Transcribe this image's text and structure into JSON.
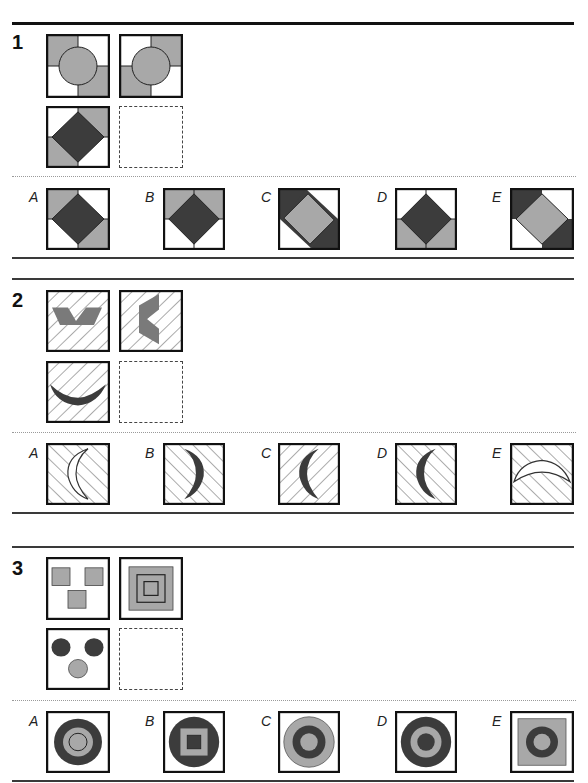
{
  "colors": {
    "dark": "#3c3c3c",
    "mid": "#a8a8a8",
    "light": "#ffffff",
    "line": "#111111"
  },
  "questions": [
    {
      "number": "1",
      "grid": [
        {
          "position": "top-left",
          "content": "circle over quadrants, grey top-left & bottom-right"
        },
        {
          "position": "top-right",
          "content": "circle over quadrants, grey top-right & bottom-left"
        },
        {
          "position": "bottom-left",
          "content": "dark diamond, grey top-right & bottom-left corners"
        },
        {
          "position": "bottom-right",
          "content": "empty (answer)"
        }
      ],
      "options": [
        {
          "label": "A"
        },
        {
          "label": "B"
        },
        {
          "label": "C"
        },
        {
          "label": "D"
        },
        {
          "label": "E"
        }
      ]
    },
    {
      "number": "2",
      "grid": [
        {
          "position": "top-left",
          "content": "grey chevron, hatched background"
        },
        {
          "position": "top-right",
          "content": "grey rotated chevron, hatched background"
        },
        {
          "position": "bottom-left",
          "content": "dark crescent (smile), hatched background"
        },
        {
          "position": "bottom-right",
          "content": "empty (answer)"
        }
      ],
      "options": [
        {
          "label": "A"
        },
        {
          "label": "B"
        },
        {
          "label": "C"
        },
        {
          "label": "D"
        },
        {
          "label": "E"
        }
      ]
    },
    {
      "number": "3",
      "grid": [
        {
          "position": "top-left",
          "content": "three grey squares"
        },
        {
          "position": "top-right",
          "content": "nested squares"
        },
        {
          "position": "bottom-left",
          "content": "two dark circles, one grey circle"
        },
        {
          "position": "bottom-right",
          "content": "empty (answer)"
        }
      ],
      "options": [
        {
          "label": "A"
        },
        {
          "label": "B"
        },
        {
          "label": "C"
        },
        {
          "label": "D"
        },
        {
          "label": "E"
        }
      ]
    }
  ]
}
